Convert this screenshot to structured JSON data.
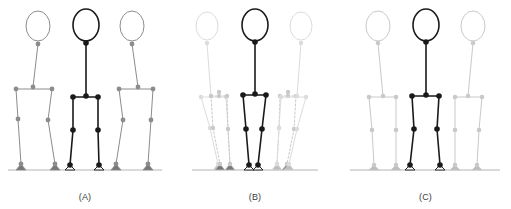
{
  "figure": {
    "background_color": "#ffffff",
    "width": 511,
    "height": 209,
    "ground_line_color": "#b4b4b4",
    "colors": {
      "primary": "#1a1a1a",
      "ghost_mid": "#8c8c8c",
      "ghost_light": "#c9c9c9",
      "ghost_faint": "#dcdcdc",
      "foot_fill_dark": "#777777",
      "foot_fill_light": "#bdbdbd",
      "foot_fill_white": "#ffffff",
      "label_text": "#3a3a3a"
    },
    "panels": [
      {
        "id": "a",
        "label": "(A)",
        "ground_y": 170,
        "ground_x1": 8,
        "ground_x2": 162,
        "description": "wide stance posture",
        "figures": [
          {
            "role": "ghost-left",
            "color": "#8c8c8c",
            "dash": "none",
            "stroke_width": 1,
            "joint_radius": 2.4,
            "head": {
              "cx": 38,
              "cy": 26,
              "rx": 12,
              "ry": 15
            },
            "foot_style": "filled-dark",
            "points": {
              "neck": [
                38,
                44
              ],
              "pelvis": [
                33,
                87
              ],
              "hip_left": [
                16,
                89
              ],
              "hip_right": [
                52,
                89
              ],
              "knee_left": [
                18,
                119
              ],
              "knee_right": [
                48,
                120
              ],
              "ankle_left": [
                21,
                164
              ],
              "ankle_right": [
                55,
                164
              ]
            }
          },
          {
            "role": "center",
            "color": "#1a1a1a",
            "dash": "none",
            "stroke_width": 1.6,
            "joint_radius": 2.8,
            "head": {
              "cx": 86,
              "cy": 25,
              "rx": 13,
              "ry": 16
            },
            "foot_style": "outline-white",
            "points": {
              "neck": [
                86,
                43
              ],
              "pelvis": [
                86,
                96
              ],
              "hip_left": [
                73,
                97
              ],
              "hip_right": [
                98,
                97
              ],
              "knee_left": [
                73,
                130
              ],
              "knee_right": [
                98,
                130
              ],
              "ankle_left": [
                70,
                165
              ],
              "ankle_right": [
                99,
                165
              ]
            }
          },
          {
            "role": "ghost-right",
            "color": "#8c8c8c",
            "dash": "none",
            "stroke_width": 1,
            "joint_radius": 2.4,
            "head": {
              "cx": 132,
              "cy": 26,
              "rx": 12,
              "ry": 15
            },
            "foot_style": "filled-dark",
            "points": {
              "neck": [
                132,
                44
              ],
              "pelvis": [
                138,
                87
              ],
              "hip_left": [
                119,
                89
              ],
              "hip_right": [
                153,
                89
              ],
              "knee_left": [
                123,
                120
              ],
              "knee_right": [
                151,
                120
              ],
              "ankle_left": [
                116,
                164
              ],
              "ankle_right": [
                148,
                164
              ]
            }
          }
        ]
      },
      {
        "id": "b",
        "label": "(B)",
        "ground_y": 170,
        "ground_x1": 22,
        "ground_x2": 148,
        "description": "narrow stance posture with paired faint ghosts",
        "figures": [
          {
            "role": "ghost-left-outer",
            "color": "#dcdcdc",
            "dash": "none",
            "stroke_width": 1,
            "joint_radius": 2.2,
            "head": {
              "cx": 37,
              "cy": 26,
              "rx": 11,
              "ry": 14
            },
            "foot_style": "filled-light",
            "points": {
              "neck": [
                37,
                43
              ],
              "pelvis": [
                41,
                96
              ],
              "hip_left": [
                31,
                97
              ],
              "hip_right": [
                56,
                97
              ],
              "knee_left": [
                40,
                128
              ],
              "knee_right": [
                58,
                129
              ],
              "ankle_left": [
                48,
                164
              ],
              "ankle_right": [
                60,
                164
              ]
            }
          },
          {
            "role": "ghost-left-inner",
            "color": "#c9c9c9",
            "dash": "2,2",
            "stroke_width": 1,
            "joint_radius": 2.2,
            "head": null,
            "foot_style": "filled-dark",
            "points": {
              "neck": [
                49,
                92
              ],
              "pelvis": [
                49,
                96
              ],
              "hip_left": [
                41,
                96
              ],
              "hip_right": [
                57,
                96
              ],
              "knee_left": [
                43,
                128
              ],
              "knee_right": [
                58,
                129
              ],
              "ankle_left": [
                50,
                164
              ],
              "ankle_right": [
                60,
                164
              ]
            }
          },
          {
            "role": "center",
            "color": "#1a1a1a",
            "dash": "none",
            "stroke_width": 1.6,
            "joint_radius": 2.8,
            "head": {
              "cx": 85,
              "cy": 25,
              "rx": 13,
              "ry": 16
            },
            "foot_style": "outline-white",
            "points": {
              "neck": [
                85,
                42
              ],
              "pelvis": [
                85,
                94
              ],
              "hip_left": [
                73,
                95
              ],
              "hip_right": [
                96,
                95
              ],
              "knee_left": [
                76,
                129
              ],
              "knee_right": [
                92,
                129
              ],
              "ankle_left": [
                79,
                165
              ],
              "ankle_right": [
                88,
                165
              ]
            }
          },
          {
            "role": "ghost-right-inner",
            "color": "#c9c9c9",
            "dash": "2,2",
            "stroke_width": 1,
            "joint_radius": 2.2,
            "head": null,
            "foot_style": "filled-dark",
            "points": {
              "neck": [
                118,
                92
              ],
              "pelvis": [
                118,
                96
              ],
              "hip_left": [
                110,
                96
              ],
              "hip_right": [
                126,
                96
              ],
              "knee_left": [
                109,
                128
              ],
              "knee_right": [
                124,
                129
              ],
              "ankle_left": [
                107,
                164
              ],
              "ankle_right": [
                117,
                164
              ]
            }
          },
          {
            "role": "ghost-right-outer",
            "color": "#dcdcdc",
            "dash": "none",
            "stroke_width": 1,
            "joint_radius": 2.2,
            "head": {
              "cx": 131,
              "cy": 26,
              "rx": 11,
              "ry": 14
            },
            "foot_style": "filled-light",
            "points": {
              "neck": [
                131,
                43
              ],
              "pelvis": [
                127,
                96
              ],
              "hip_left": [
                111,
                97
              ],
              "hip_right": [
                136,
                97
              ],
              "knee_left": [
                109,
                128
              ],
              "knee_right": [
                127,
                129
              ],
              "ankle_left": [
                107,
                164
              ],
              "ankle_right": [
                119,
                164
              ]
            }
          }
        ]
      },
      {
        "id": "c",
        "label": "(C)",
        "ground_y": 170,
        "ground_x1": 10,
        "ground_x2": 160,
        "description": "medium stance posture",
        "figures": [
          {
            "role": "ghost-left",
            "color": "#c9c9c9",
            "dash": "none",
            "stroke_width": 1,
            "joint_radius": 2.3,
            "head": {
              "cx": 38,
              "cy": 26,
              "rx": 12,
              "ry": 15
            },
            "foot_style": "filled-light",
            "points": {
              "neck": [
                38,
                43
              ],
              "pelvis": [
                43,
                96
              ],
              "hip_left": [
                29,
                97
              ],
              "hip_right": [
                56,
                97
              ],
              "knee_left": [
                32,
                130
              ],
              "knee_right": [
                56,
                130
              ],
              "ankle_left": [
                34,
                165
              ],
              "ankle_right": [
                56,
                165
              ]
            }
          },
          {
            "role": "center",
            "color": "#1a1a1a",
            "dash": "none",
            "stroke_width": 1.6,
            "joint_radius": 2.8,
            "head": {
              "cx": 86,
              "cy": 25,
              "rx": 13,
              "ry": 16
            },
            "foot_style": "outline-white",
            "points": {
              "neck": [
                86,
                42
              ],
              "pelvis": [
                86,
                95
              ],
              "hip_left": [
                72,
                96
              ],
              "hip_right": [
                99,
                96
              ],
              "knee_left": [
                74,
                129
              ],
              "knee_right": [
                97,
                129
              ],
              "ankle_left": [
                70,
                165
              ],
              "ankle_right": [
                100,
                165
              ]
            }
          },
          {
            "role": "ghost-right",
            "color": "#c9c9c9",
            "dash": "none",
            "stroke_width": 1,
            "joint_radius": 2.3,
            "head": {
              "cx": 133,
              "cy": 26,
              "rx": 12,
              "ry": 15
            },
            "foot_style": "filled-light",
            "points": {
              "neck": [
                133,
                43
              ],
              "pelvis": [
                128,
                96
              ],
              "hip_left": [
                115,
                97
              ],
              "hip_right": [
                142,
                97
              ],
              "knee_left": [
                115,
                130
              ],
              "knee_right": [
                139,
                130
              ],
              "ankle_left": [
                115,
                165
              ],
              "ankle_right": [
                137,
                165
              ]
            }
          }
        ]
      }
    ]
  }
}
